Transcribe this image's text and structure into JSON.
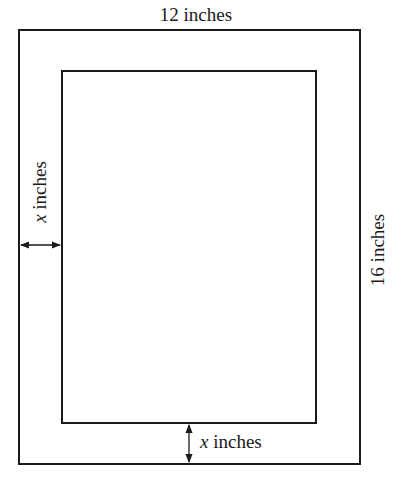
{
  "diagram": {
    "type": "picture-frame-dimension-diagram",
    "outer_frame": {
      "width_label": "12 inches",
      "height_label": "16 inches"
    },
    "inner_picture": {
      "description": "inner rectangle inset uniformly by border width"
    },
    "border_labels": {
      "left": {
        "variable": "x",
        "unit": "inches"
      },
      "bottom": {
        "variable": "x",
        "unit": "inches"
      }
    }
  }
}
